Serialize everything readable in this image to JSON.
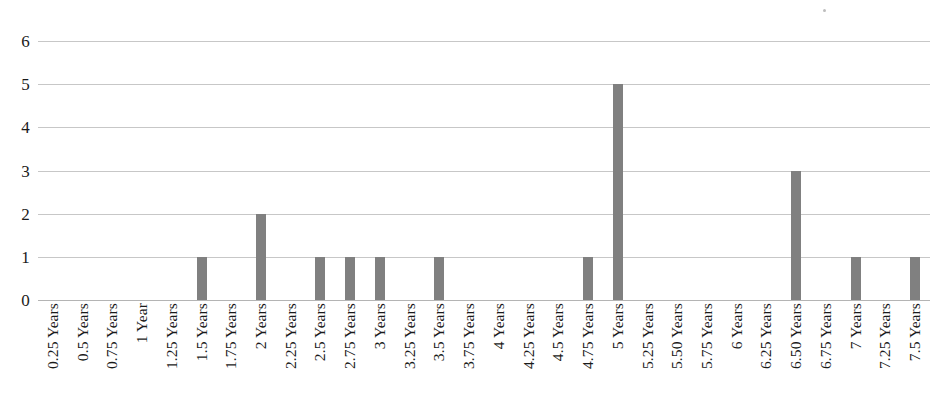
{
  "chart_data": {
    "type": "bar",
    "title": "",
    "subtitle": "",
    "xlabel": "",
    "ylabel": "",
    "ylim": [
      0,
      6
    ],
    "y_ticks": [
      0,
      1,
      2,
      3,
      4,
      5,
      6
    ],
    "grid": true,
    "legend": false,
    "legend_position": "none",
    "bar_color": "#808080",
    "gridline_color": "#c7c7c7",
    "categories": [
      "0.25 Years",
      "0.5 Years",
      "0.75 Years",
      "1 Year",
      "1.25 Years",
      "1.5 Years",
      "1.75 Years",
      "2 Years",
      "2.25 Years",
      "2.5 Years",
      "2.75 Years",
      "3 Years",
      "3.25 Years",
      "3.5 Years",
      "3.75 Years",
      "4 Years",
      "4.25 Years",
      "4.5 Years",
      "4.75 Years",
      "5 Years",
      "5.25 Years",
      "5.50 Years",
      "5.75 Years",
      "6 Years",
      "6.25 Years",
      "6.50 Years",
      "6.75 Years",
      "7 Years",
      "7.25 Years",
      "7.5 Years"
    ],
    "values": [
      0,
      0,
      0,
      0,
      0,
      1,
      0,
      2,
      0,
      1,
      1,
      1,
      0,
      1,
      0,
      0,
      0,
      0,
      1,
      5,
      0,
      0,
      0,
      0,
      0,
      3,
      0,
      1,
      0,
      1
    ]
  }
}
